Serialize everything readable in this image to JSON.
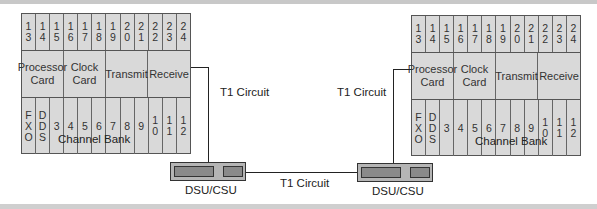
{
  "diagram": {
    "left_bank": {
      "label": "Channel Bank",
      "top_slots": [
        "1\n3",
        "1\n4",
        "1\n5",
        "1\n6",
        "1\n7",
        "1\n8",
        "1\n9",
        "2\n0",
        "2\n1",
        "2\n2",
        "2\n3",
        "2\n4"
      ],
      "cards": [
        "Processor\nCard",
        "Clock\nCard",
        "Transmit",
        "Receive"
      ],
      "bottom_slots": [
        "F\nX\nO",
        "D\nD\nS",
        "3",
        "4",
        "5",
        "6",
        "7",
        "8",
        "9",
        "1\n0",
        "1\n1",
        "1\n2"
      ]
    },
    "right_bank": {
      "label": "Channel Bank",
      "top_slots": [
        "1\n3",
        "1\n4",
        "1\n5",
        "1\n6",
        "1\n7",
        "1\n8",
        "1\n9",
        "2\n0",
        "2\n1",
        "2\n2",
        "2\n3",
        "2\n4"
      ],
      "cards": [
        "Processor\nCard",
        "Clock\nCard",
        "Transmit",
        "Receive"
      ],
      "bottom_slots": [
        "F\nX\nO",
        "D\nD\nS",
        "3",
        "4",
        "5",
        "6",
        "7",
        "8",
        "9",
        "1\n0",
        "1\n1",
        "1\n2"
      ]
    },
    "links": {
      "left_t1": "T1 Circuit",
      "right_t1": "T1 Circuit",
      "middle_t1": "T1 Circuit"
    },
    "devices": {
      "left_dsu": "DSU/CSU",
      "right_dsu": "DSU/CSU"
    }
  }
}
